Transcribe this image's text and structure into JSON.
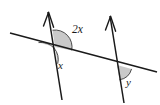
{
  "figure": {
    "type": "geometry-diagram",
    "background_color": "#ffffff",
    "line_color": "#1a1a1a",
    "angle_fill_color": "#c9c9c9",
    "angle_arc_color": "#3a3a3a",
    "labels": {
      "angle_2x": "2x",
      "angle_x": "x",
      "angle_y": "y"
    },
    "elements": {
      "parallel_line_left": "parallel-line-left",
      "parallel_line_right": "parallel-line-right",
      "transversal": "transversal-line",
      "arrow_left": "arrowhead-up-left",
      "arrow_right": "arrowhead-up-right"
    },
    "geometry": {
      "left_intersection": [
        55,
        47
      ],
      "right_intersection": [
        117,
        65
      ],
      "transversal_start": [
        10,
        33
      ],
      "transversal_end": [
        157,
        72
      ],
      "left_line_top": [
        48,
        10
      ],
      "left_line_bottom": [
        62,
        100
      ],
      "right_line_top": [
        110,
        14
      ],
      "right_line_bottom": [
        124,
        103
      ]
    }
  }
}
